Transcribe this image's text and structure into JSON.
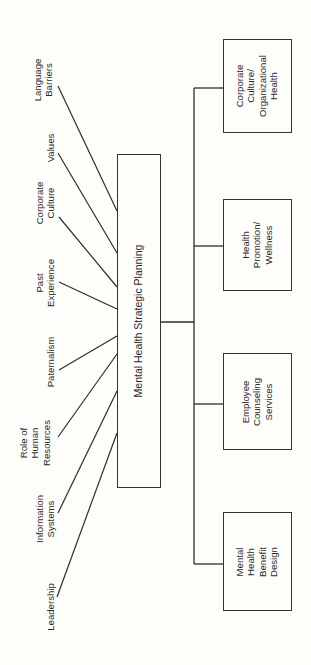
{
  "central": {
    "label": "Mental Health Strategic Planning"
  },
  "factors": [
    {
      "id": "language-barriers",
      "label": "Language\nBarriers",
      "cx": 43,
      "cy": 80,
      "line": [
        58,
        86,
        117,
        211
      ]
    },
    {
      "id": "values",
      "label": "Values",
      "cx": 51,
      "cy": 148,
      "line": [
        58,
        153,
        117,
        253
      ]
    },
    {
      "id": "corporate-culture",
      "label": "Corporate\nCulture",
      "cx": 45,
      "cy": 203,
      "line": [
        59,
        217,
        117,
        287
      ]
    },
    {
      "id": "past-experience",
      "label": "Past\nExperience",
      "cx": 45,
      "cy": 283,
      "line": [
        59,
        282,
        117,
        309
      ]
    },
    {
      "id": "paternalism",
      "label": "Paternalism",
      "cx": 51,
      "cy": 362,
      "line": [
        59,
        370,
        117,
        336
      ]
    },
    {
      "id": "role-of-human-resources",
      "label": "Role of\nHuman\nResources",
      "cx": 35,
      "cy": 443,
      "line": [
        58,
        437,
        117,
        354
      ]
    },
    {
      "id": "information-systems",
      "label": "Information\nSystems",
      "cx": 45,
      "cy": 519,
      "line": [
        58,
        513,
        117,
        391
      ]
    },
    {
      "id": "leadership",
      "label": "Leadership",
      "cx": 51,
      "cy": 607,
      "line": [
        57,
        597,
        117,
        433
      ]
    }
  ],
  "outcomes": [
    {
      "id": "corporate-culture-organizational-health",
      "label": "Corporate\nCulture/\nOrganizational\nHealth",
      "top": 39,
      "bottom": 133,
      "connector_y": 88
    },
    {
      "id": "health-promotion-wellness",
      "label": "Health\nPromotion/\nWellness",
      "top": 199,
      "bottom": 291,
      "connector_y": 246
    },
    {
      "id": "employee-counseling-services",
      "label": "Employee\nCounseling\nServices",
      "top": 353,
      "bottom": 450,
      "connector_y": 404
    },
    {
      "id": "mental-health-benefit-design",
      "label": "Mental\nHealth\nBenefit\nDesign",
      "top": 512,
      "bottom": 611,
      "connector_y": 564
    }
  ],
  "colors": {
    "line": "#2e2e2e",
    "background": "#fdfdfa",
    "text": "#2b2b2b"
  }
}
